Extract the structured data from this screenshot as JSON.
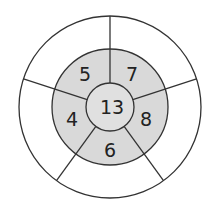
{
  "diagram": {
    "type": "number-wheel-puzzle",
    "center_value": "13",
    "ring_values": [
      "5",
      "7",
      "8",
      "6",
      "4"
    ],
    "outer_values": [
      "",
      "",
      "",
      "",
      ""
    ],
    "colors": {
      "stroke": "#333333",
      "ring_fill": "#d9d9d9",
      "center_fill": "#e0e0e0",
      "outer_fill": "#ffffff"
    }
  }
}
